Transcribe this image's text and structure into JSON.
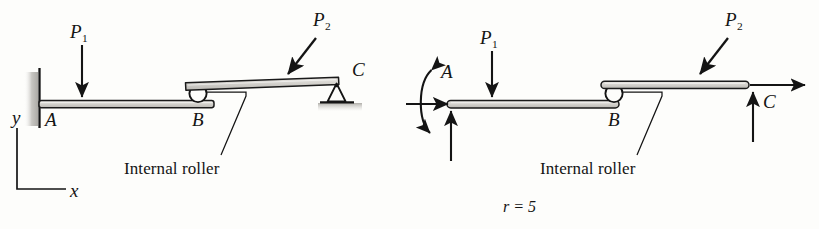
{
  "figure": {
    "background_color": "#fdfdfb",
    "ink_color": "#141414",
    "beam_fill_color": "#c9c7c2",
    "ground_shade_color": "#bfbdb8"
  },
  "left_diagram": {
    "name": "structural-diagram",
    "axes": {
      "y_label": "y",
      "x_label": "x"
    },
    "points": {
      "a": "A",
      "b": "B",
      "c": "C"
    },
    "loads": [
      {
        "label": "P",
        "subscript": "1",
        "direction": "down"
      },
      {
        "label": "P",
        "subscript": "2",
        "direction": "down-left-diagonal"
      }
    ],
    "annotation": "Internal roller",
    "supports": {
      "a_type": "fixed-wall",
      "b_type": "internal-roller",
      "c_type": "pin-support"
    }
  },
  "right_diagram": {
    "name": "free-body-diagram",
    "points": {
      "a": "A",
      "b": "B",
      "c": "C"
    },
    "loads": [
      {
        "label": "P",
        "subscript": "1",
        "direction": "down"
      },
      {
        "label": "P",
        "subscript": "2",
        "direction": "down-left-diagonal"
      }
    ],
    "annotation": "Internal roller",
    "reaction_count": "r = 5",
    "reactions_at_a": [
      "moment-arc",
      "horizontal-right",
      "vertical-up"
    ],
    "reactions_at_c": [
      "horizontal-right",
      "vertical-up"
    ]
  }
}
